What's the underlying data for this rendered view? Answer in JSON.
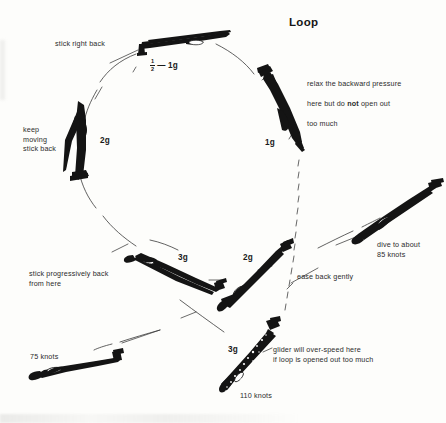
{
  "figure": {
    "title": "Loop",
    "type": "aerobatic-maneuver-diagram"
  },
  "g_labels": {
    "top": {
      "numerator": "1",
      "denominator": "2",
      "tail": "— 1g"
    },
    "right_upper": "1g",
    "left_upper": "2g",
    "bottom_left_mid": "3g",
    "bottom_mid": "2g",
    "bottom_center": "3g"
  },
  "speeds": {
    "dive_entry": "75 knots",
    "bottom_peak": "110 knots"
  },
  "callouts": {
    "stick_right_back": "stick right back",
    "relax_pressure_line1": "relax the backward pressure",
    "relax_pressure_line2_pre": "here but do ",
    "relax_pressure_line2_bold": "not",
    "relax_pressure_line2_post": " open out",
    "relax_pressure_line3": "too much",
    "keep_moving": "keep\nmoving\nstick back",
    "dive_to_about": "dive to about\n85 knots",
    "stick_progressively": "stick progressively back\nfrom here",
    "ease_back_gently": "ease back gently",
    "overspeed": "glider will over-speed here\nif loop is opened out too much"
  },
  "colors": {
    "ink": "#1a1a1a",
    "text": "#2b2b2b",
    "paper": "#fdfdfb"
  }
}
